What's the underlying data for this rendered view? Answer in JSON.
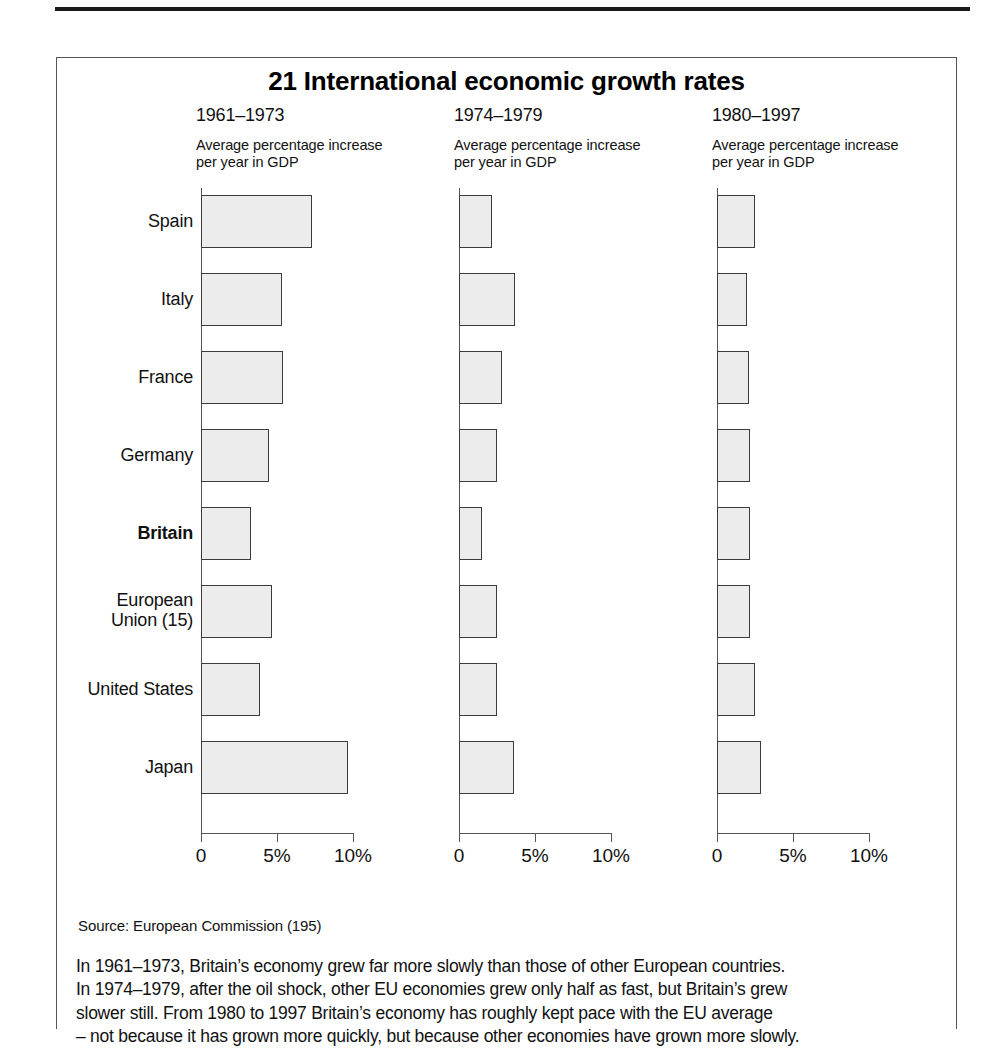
{
  "figure": {
    "title": "21 International economic growth rates",
    "source": "Source: European Commission (195)",
    "caption": "In 1961–1973, Britain’s economy grew far more slowly than those of other European countries.\nIn 1974–1979, after the oil shock, other EU economies grew only half as fast, but Britain’s grew\n slower still. From 1980 to 1997 Britain’s economy has roughly kept pace with the EU average\n– not because it has grown more quickly, but because other economies have grown more slowly."
  },
  "panels": [
    {
      "period": "1961–1973",
      "subtitle": "Average percentage increase\nper year in GDP"
    },
    {
      "period": "1974–1979",
      "subtitle": "Average percentage increase\nper year in GDP"
    },
    {
      "period": "1980–1997",
      "subtitle": "Average percentage increase\nper year in GDP"
    }
  ],
  "axis": {
    "ticks": [
      {
        "value": 0,
        "label": "0"
      },
      {
        "value": 5,
        "label": "5%"
      },
      {
        "value": 10,
        "label": "10%"
      }
    ],
    "min": 0,
    "max": 10
  },
  "categories": [
    {
      "label": "Spain",
      "bold": false
    },
    {
      "label": "Italy",
      "bold": false
    },
    {
      "label": "France",
      "bold": false
    },
    {
      "label": "Germany",
      "bold": false
    },
    {
      "label": "Britain",
      "bold": true
    },
    {
      "label": "European\nUnion (15)",
      "bold": false
    },
    {
      "label": "United States",
      "bold": false
    },
    {
      "label": "Japan",
      "bold": false
    }
  ],
  "colors": {
    "bar_fill": "#ececec",
    "bar_border": "#3b3b3b",
    "axis": "#555555",
    "text": "#111111",
    "rule": "#1a1a1a"
  },
  "chart_data": {
    "type": "bar",
    "title": "21 International economic growth rates",
    "xlabel": "Average percentage increase per year in GDP",
    "ylabel": "",
    "xlim": [
      0,
      10
    ],
    "grid": false,
    "legend": "none",
    "orientation": "horizontal",
    "categories": [
      "Spain",
      "Italy",
      "France",
      "Germany",
      "Britain",
      "European Union (15)",
      "United States",
      "Japan"
    ],
    "series": [
      {
        "name": "1961–1973",
        "values": [
          7.3,
          5.3,
          5.4,
          4.5,
          3.3,
          4.7,
          3.9,
          9.7
        ]
      },
      {
        "name": "1974–1979",
        "values": [
          2.2,
          3.7,
          2.8,
          2.5,
          1.5,
          2.5,
          2.5,
          3.6
        ]
      },
      {
        "name": "1980–1997",
        "values": [
          2.5,
          2.0,
          2.1,
          2.2,
          2.2,
          2.2,
          2.5,
          2.9
        ]
      }
    ],
    "units": "percent per year",
    "source": "European Commission (195)"
  }
}
